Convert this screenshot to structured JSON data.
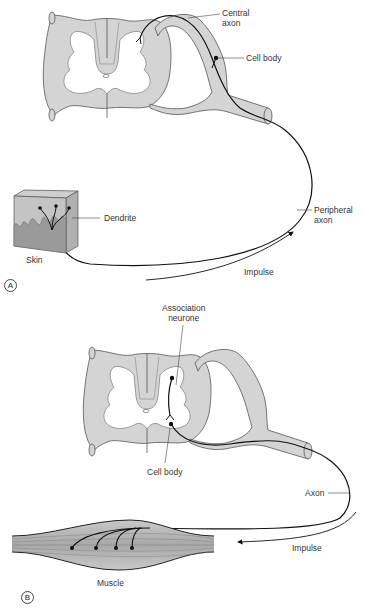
{
  "figure": {
    "colors": {
      "cord_fill": "#d4d4d4",
      "grey_matter": "#ffffff",
      "outline": "#555555",
      "nerve": "#111111",
      "skin_top": "#a9a9a9",
      "skin_mid": "#bdbdbd",
      "skin_deep": "#8e8e8e",
      "muscle": "#b5b5b5"
    },
    "panels": [
      {
        "id": "A",
        "letter": "A",
        "labels": {
          "central_axon": "Central\naxon",
          "cell_body": "Cell body",
          "dendrite": "Dendrite",
          "skin": "Skin",
          "peripheral_axon": "Peripheral\naxon",
          "impulse": "Impulse"
        }
      },
      {
        "id": "B",
        "letter": "B",
        "labels": {
          "association_neurone": "Association\nneurone",
          "cell_body": "Cell body",
          "axon": "Axon",
          "impulse": "Impulse",
          "muscle": "Muscle"
        }
      }
    ]
  }
}
